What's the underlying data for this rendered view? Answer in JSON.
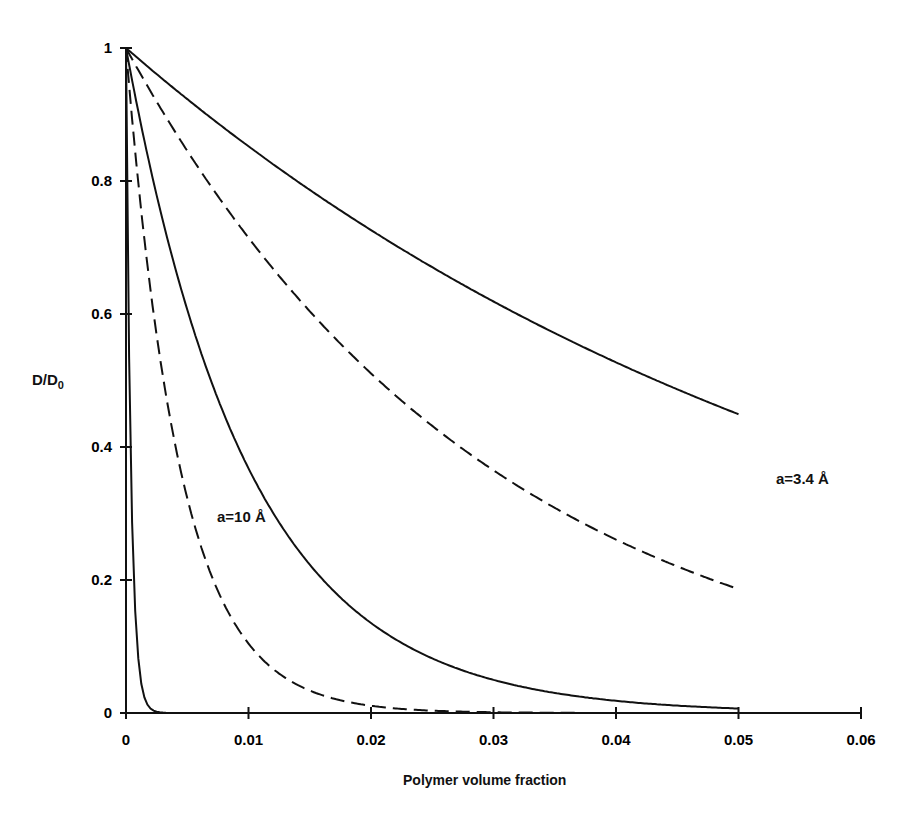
{
  "chart_data": {
    "type": "line",
    "title": "",
    "xlabel": "Polymer volume fraction",
    "ylabel": "D/D0",
    "xlim": [
      0,
      0.06
    ],
    "ylim": [
      0,
      1
    ],
    "grid": false,
    "x_ticks": [
      "0",
      "0.01",
      "0.02",
      "0.03",
      "0.04",
      "0.05",
      "0.06"
    ],
    "y_ticks": [
      "0",
      "0.2",
      "0.4",
      "0.6",
      "0.8",
      "1"
    ],
    "annotations": [
      {
        "text": "a=3.4 Å",
        "x": 0.054,
        "y": 0.35
      },
      {
        "text": "a=10 Å",
        "x": 0.0075,
        "y": 0.3
      }
    ],
    "series": [
      {
        "name": "a=3.4 Å (solid)",
        "style": "solid",
        "x": [
          0,
          0.01,
          0.02,
          0.03,
          0.04,
          0.05
        ],
        "y": [
          1.0,
          0.85,
          0.73,
          0.62,
          0.53,
          0.45
        ]
      },
      {
        "name": "a=3.4 Å (dashed)",
        "style": "dashed",
        "x": [
          0,
          0.01,
          0.02,
          0.03,
          0.04,
          0.05
        ],
        "y": [
          1.0,
          0.71,
          0.51,
          0.36,
          0.26,
          0.19
        ]
      },
      {
        "name": "a=10 Å (solid)",
        "style": "solid",
        "x": [
          0,
          0.01,
          0.02,
          0.03,
          0.04,
          0.05
        ],
        "y": [
          1.0,
          0.37,
          0.135,
          0.05,
          0.018,
          0.007
        ]
      },
      {
        "name": "a=10 Å (dashed)",
        "style": "dashed",
        "x": [
          0,
          0.01,
          0.02,
          0.03,
          0.04,
          0.05
        ],
        "y": [
          1.0,
          0.104,
          0.011,
          0.001,
          0.0,
          0.0
        ]
      }
    ]
  },
  "labels": {
    "xlabel": "Polymer volume fraction",
    "ylabel_main": "D/D",
    "ylabel_sub": "0",
    "ann1": "a=3.4 Å",
    "ann2": "a=10 Å"
  }
}
